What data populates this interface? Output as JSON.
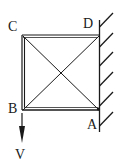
{
  "diagram": {
    "nodes": [
      {
        "id": "A",
        "label": "A",
        "x": 99,
        "y": 109
      },
      {
        "id": "B",
        "label": "B",
        "x": 22,
        "y": 109
      },
      {
        "id": "C",
        "label": "C",
        "x": 22,
        "y": 35
      },
      {
        "id": "D",
        "label": "D",
        "x": 99,
        "y": 35
      }
    ],
    "members": [
      {
        "from": "C",
        "to": "D"
      },
      {
        "from": "D",
        "to": "A"
      },
      {
        "from": "A",
        "to": "B"
      },
      {
        "from": "B",
        "to": "C"
      },
      {
        "from": "C",
        "to": "A"
      },
      {
        "from": "B",
        "to": "D"
      }
    ],
    "support": {
      "type": "fixed-wall",
      "side": "right",
      "hatch_count": 6
    },
    "load": {
      "label": "V",
      "at": "B",
      "direction": "down"
    },
    "colors": {
      "line": "#1a1a1a",
      "background": "#ffffff"
    }
  }
}
